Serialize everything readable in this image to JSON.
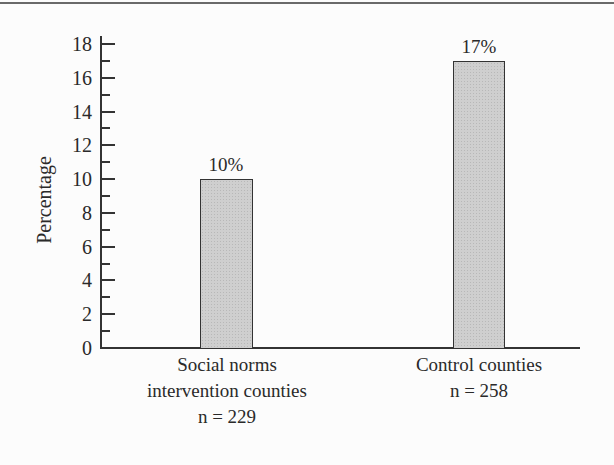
{
  "chart_data": {
    "type": "bar",
    "title": "",
    "xlabel": "",
    "ylabel": "Percentage",
    "ylim": [
      0,
      18
    ],
    "yticks": [
      0,
      2,
      4,
      6,
      8,
      10,
      12,
      14,
      16,
      18
    ],
    "yticks_minor": [
      1,
      3,
      5,
      7,
      9,
      11,
      13,
      15,
      17
    ],
    "grid": false,
    "legend": null,
    "categories": [
      "Social norms intervention counties n = 229",
      "Control counties n = 258"
    ],
    "category_lines": [
      [
        "Social norms",
        "intervention counties",
        "n = 229"
      ],
      [
        "Control counties",
        "n = 258"
      ]
    ],
    "values": [
      10,
      17
    ],
    "data_labels": [
      "10%",
      "17%"
    ],
    "bar_color": "#cfcfcf"
  },
  "labels": {
    "ylabel": "Percentage",
    "yticks": [
      "0",
      "2",
      "4",
      "6",
      "8",
      "10",
      "12",
      "14",
      "16",
      "18"
    ],
    "bar1_value": "10%",
    "bar2_value": "17%",
    "cat1_line1": "Social norms",
    "cat1_line2": "intervention counties",
    "cat1_line3": "n = 229",
    "cat2_line1": "Control counties",
    "cat2_line2": "n = 258"
  }
}
